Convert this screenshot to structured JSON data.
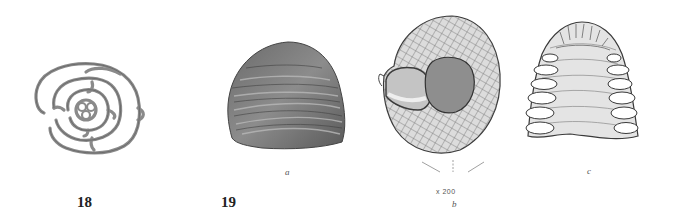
{
  "plate": {
    "figures": [
      {
        "number": "18",
        "subject": "spiral-chambered foraminifera section (outline)",
        "views": []
      },
      {
        "number": "19",
        "subject": "dome-shaped foraminifera test",
        "views": [
          {
            "label": "a",
            "description": "exterior side view"
          },
          {
            "label": "b",
            "description": "basal view showing reticulate surface",
            "magnification": "x 200"
          },
          {
            "label": "c",
            "description": "vertical section showing chambers"
          }
        ]
      }
    ],
    "colors": {
      "background": "#ffffff",
      "ink": "#3a3a3a",
      "shade": "#8a8a8a"
    }
  }
}
